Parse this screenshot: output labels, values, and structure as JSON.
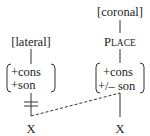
{
  "diagram": {
    "type": "autosegmental feature geometry",
    "left_segment": {
      "feature": "[lateral]",
      "matrix": [
        "+cons",
        "+son"
      ],
      "association_blocked": true,
      "timing_slot": "X"
    },
    "right_segment": {
      "feature": "[coronal]",
      "node_first": "P",
      "node_rest": "LACE",
      "matrix": [
        "+cons",
        "+/– son"
      ],
      "timing_slot": "X"
    },
    "spreading": {
      "from": "right matrix",
      "to": "left X",
      "style": "dashed"
    },
    "colors": {
      "ink": "#222222",
      "background": "#ffffff"
    }
  }
}
